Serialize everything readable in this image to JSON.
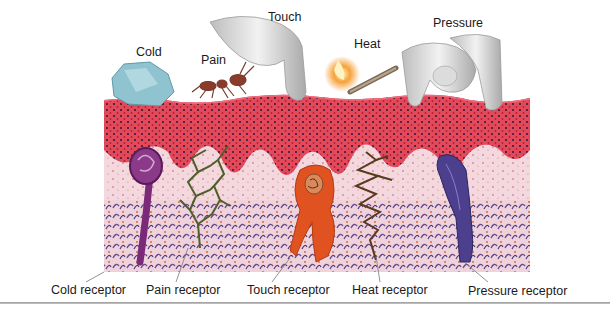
{
  "figure": {
    "stimuli": [
      {
        "id": "cold",
        "label": "Cold",
        "object": "ice-cube"
      },
      {
        "id": "pain",
        "label": "Pain",
        "object": "ant"
      },
      {
        "id": "touch",
        "label": "Touch",
        "object": "finger"
      },
      {
        "id": "heat",
        "label": "Heat",
        "object": "lit-match"
      },
      {
        "id": "pressure",
        "label": "Pressure",
        "object": "pinching-fingers"
      }
    ],
    "receptors": [
      {
        "id": "cold",
        "label": "Cold receptor",
        "color": "#7a2a78"
      },
      {
        "id": "pain",
        "label": "Pain receptor",
        "color": "#4f5e2a"
      },
      {
        "id": "touch",
        "label": "Touch receptor",
        "color": "#e0521f"
      },
      {
        "id": "heat",
        "label": "Heat receptor",
        "color": "#5a3a1e"
      },
      {
        "id": "pressure",
        "label": "Pressure receptor",
        "color": "#4b3f8e"
      }
    ],
    "colors": {
      "epidermis": "#e0475a",
      "dermis": "#f1cdd6",
      "deep_dermis": "#6b4a8c",
      "ice": "#8fc3cf",
      "skin_finger": "#e6e6e6"
    }
  }
}
